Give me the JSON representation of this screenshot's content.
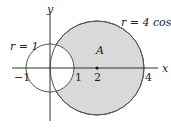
{
  "figure": {
    "type": "polar-region-diagram",
    "curves": [
      {
        "name": "outer-circle",
        "equation": "r = 4 cos θ",
        "center": [
          2,
          0
        ],
        "radius": 2
      },
      {
        "name": "unit-circle",
        "equation": "r = 1",
        "center": [
          0,
          0
        ],
        "radius": 1
      }
    ],
    "region": {
      "label": "A",
      "description": "inside r = 4 cos θ, outside r = 1",
      "fill": "#d9d9d9"
    },
    "axis_labels": {
      "x": "x",
      "y": "y"
    },
    "tick_labels": {
      "neg_one": "−1",
      "one": "1",
      "two": "2",
      "four": "4"
    },
    "curve_labels": {
      "outer": "r = 4 cos θ",
      "inner": "r = 1"
    },
    "region_label": "A",
    "colors": {
      "line": "#555555",
      "shade": "#d9d9d9",
      "text": "#222222"
    }
  }
}
